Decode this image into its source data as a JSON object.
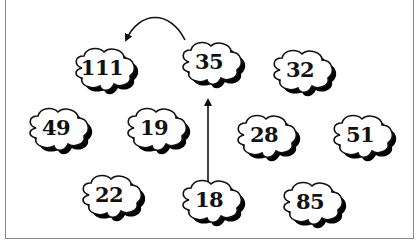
{
  "diagram": {
    "type": "number-clouds-puzzle",
    "clouds": [
      {
        "label": "111",
        "x": 68,
        "y": 44
      },
      {
        "label": "35",
        "x": 175,
        "y": 38
      },
      {
        "label": "32",
        "x": 266,
        "y": 46
      },
      {
        "label": "49",
        "x": 22,
        "y": 104
      },
      {
        "label": "19",
        "x": 120,
        "y": 104
      },
      {
        "label": "28",
        "x": 230,
        "y": 111
      },
      {
        "label": "51",
        "x": 326,
        "y": 111
      },
      {
        "label": "22",
        "x": 75,
        "y": 171
      },
      {
        "label": "18",
        "x": 175,
        "y": 176
      },
      {
        "label": "85",
        "x": 276,
        "y": 178
      }
    ],
    "arrows": [
      {
        "from": "18",
        "to": "35",
        "shape": "straight",
        "direction": "up"
      },
      {
        "from": "35",
        "to": "111",
        "shape": "curved",
        "direction": "left"
      }
    ],
    "colors": {
      "stroke": "#111111",
      "fill": "#ffffff",
      "shadow": "#000000",
      "frame": "#8a8a8a"
    }
  }
}
